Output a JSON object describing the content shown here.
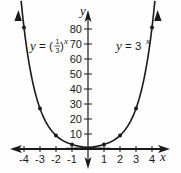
{
  "chart_data": {
    "type": "line",
    "title": "",
    "xlabel": "x",
    "ylabel": "y",
    "xlim": [
      -4.3,
      4.3
    ],
    "ylim": [
      0,
      90
    ],
    "x_ticks": [
      -4,
      -3,
      -2,
      -1,
      1,
      2,
      3,
      4
    ],
    "x_tick_labels": [
      "-4",
      "-3",
      "-2",
      "-1",
      "1",
      "2",
      "3",
      "4"
    ],
    "y_ticks": [
      10,
      20,
      30,
      40,
      50,
      60,
      70,
      80
    ],
    "y_tick_labels": [
      "10",
      "20",
      "30",
      "40",
      "50",
      "60",
      "70",
      "80"
    ],
    "grid": false,
    "legend": "inline labels",
    "series": [
      {
        "name": "y = (1/3)^x",
        "label_text": "y = (1/3)^x",
        "points": [
          [
            -4,
            81
          ],
          [
            -3,
            27
          ],
          [
            -2,
            9
          ],
          [
            -1,
            3
          ],
          [
            0,
            1
          ],
          [
            1,
            0.333
          ],
          [
            2,
            0.111
          ],
          [
            3,
            0.037
          ],
          [
            4,
            0.012
          ]
        ],
        "marked_points": [
          [
            -4,
            81
          ],
          [
            -3,
            27
          ],
          [
            -2,
            9
          ],
          [
            -1,
            3
          ]
        ]
      },
      {
        "name": "y = 3^x",
        "label_text": "y = 3^x",
        "points": [
          [
            -4,
            0.012
          ],
          [
            -3,
            0.037
          ],
          [
            -2,
            0.111
          ],
          [
            -1,
            0.333
          ],
          [
            0,
            1
          ],
          [
            1,
            3
          ],
          [
            2,
            9
          ],
          [
            3,
            27
          ],
          [
            4,
            81
          ]
        ],
        "marked_points": [
          [
            1,
            3
          ],
          [
            2,
            9
          ],
          [
            3,
            27
          ],
          [
            4,
            81
          ]
        ]
      }
    ]
  },
  "labels": {
    "x_axis": "x",
    "y_axis": "y",
    "left_curve": {
      "prefix": "y = (",
      "num": "1",
      "den": "3",
      "suffix": ")",
      "exp": "x"
    },
    "right_curve": {
      "prefix": "y = 3",
      "exp": "x"
    }
  },
  "colors": {
    "ink": "#1a1a1a",
    "background": "#fdfdfd"
  }
}
